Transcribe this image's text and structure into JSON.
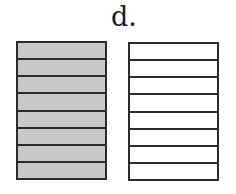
{
  "label": "d.",
  "diagram": {
    "type": "fraction-model",
    "boxes": [
      {
        "id": "left",
        "parts": 8,
        "shaded": 8,
        "shade_color": "#c8c8c8",
        "empty_color": "#ffffff"
      },
      {
        "id": "right",
        "parts": 8,
        "shaded": 0,
        "shade_color": "#c8c8c8",
        "empty_color": "#ffffff"
      }
    ],
    "line_color": "#2a2a2a"
  }
}
